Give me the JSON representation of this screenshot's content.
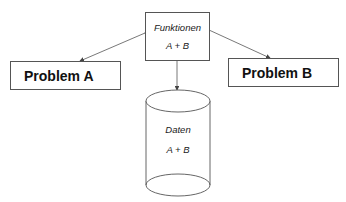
{
  "diagram": {
    "functions_box": {
      "title": "Funktionen",
      "content": "A + B"
    },
    "problem_a": {
      "label": "Problem A"
    },
    "problem_b": {
      "label": "Problem B"
    },
    "database": {
      "title": "Daten",
      "content": "A + B"
    },
    "edges": [
      {
        "from": "Funktionen",
        "to": "Problem A",
        "type": "bidirectional-arrow"
      },
      {
        "from": "Funktionen",
        "to": "Problem B",
        "type": "bidirectional-arrow"
      },
      {
        "from": "Funktionen",
        "to": "Daten",
        "type": "bidirectional-arrow"
      }
    ],
    "colors": {
      "stroke": "#555555",
      "text": "#111111",
      "background": "#ffffff"
    }
  }
}
